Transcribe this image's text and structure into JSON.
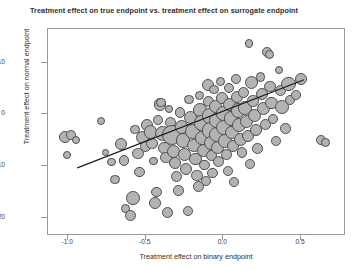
{
  "chart_data": {
    "type": "scatter",
    "title": "Treatment effect on true endpoint vs. treatment effect on surrogate endpoint",
    "xlabel": "Treatment effect on binary endpoint",
    "ylabel": "Treatment effect on normal endpoint",
    "xlim": [
      -1.13,
      0.79
    ],
    "ylim": [
      -23.5,
      16.5
    ],
    "xticks": [
      -1.0,
      -0.5,
      0.0,
      0.5
    ],
    "xtick_labels": [
      "-1.0",
      "-0.5",
      "0.0",
      "0.5"
    ],
    "yticks": [
      10,
      0,
      -10,
      -20
    ],
    "ytick_labels": [
      "10",
      "0",
      "-10",
      "-20"
    ],
    "grid": false,
    "legend": null,
    "marker_fill": "#b3b3b3",
    "marker_edge": "#4f4f4f",
    "line_color": "#1a1a1a",
    "frame_color": "#9a9a9a",
    "regression_line": {
      "x0": -0.94,
      "y0": -10.6,
      "x1": 0.53,
      "y1": 6.6
    },
    "size_encoding": "bubble area proportional to study weight",
    "points": [
      {
        "x": -1.02,
        "y": -4.3,
        "s": 7.5
      },
      {
        "x": -0.98,
        "y": -4.0,
        "s": 6.0
      },
      {
        "x": -0.95,
        "y": -4.9,
        "s": 5.0
      },
      {
        "x": -1.01,
        "y": -7.9,
        "s": 5.0
      },
      {
        "x": -0.79,
        "y": -1.2,
        "s": 5.0
      },
      {
        "x": -0.76,
        "y": -7.3,
        "s": 4.2
      },
      {
        "x": -0.72,
        "y": -9.2,
        "s": 5.5
      },
      {
        "x": -0.7,
        "y": -12.6,
        "s": 6.0
      },
      {
        "x": -0.66,
        "y": -5.8,
        "s": 7.5
      },
      {
        "x": -0.64,
        "y": -8.9,
        "s": 6.5
      },
      {
        "x": -0.63,
        "y": -18.2,
        "s": 6.0
      },
      {
        "x": -0.6,
        "y": -19.6,
        "s": 7.0
      },
      {
        "x": -0.58,
        "y": -16.1,
        "s": 8.5
      },
      {
        "x": -0.57,
        "y": -2.9,
        "s": 6.0
      },
      {
        "x": -0.55,
        "y": -7.6,
        "s": 7.0
      },
      {
        "x": -0.54,
        "y": -11.1,
        "s": 6.5
      },
      {
        "x": -0.52,
        "y": -4.4,
        "s": 8.0
      },
      {
        "x": -0.5,
        "y": -6.2,
        "s": 7.0
      },
      {
        "x": -0.49,
        "y": -2.0,
        "s": 7.5
      },
      {
        "x": -0.47,
        "y": -3.4,
        "s": 8.5
      },
      {
        "x": -0.46,
        "y": -5.6,
        "s": 7.0
      },
      {
        "x": -0.45,
        "y": -9.0,
        "s": 5.5
      },
      {
        "x": -0.44,
        "y": -17.2,
        "s": 7.5
      },
      {
        "x": -0.43,
        "y": -15.0,
        "s": 6.5
      },
      {
        "x": -0.42,
        "y": -1.1,
        "s": 6.0
      },
      {
        "x": -0.41,
        "y": 1.9,
        "s": 7.5
      },
      {
        "x": -0.4,
        "y": 2.3,
        "s": 6.0
      },
      {
        "x": -0.39,
        "y": -3.7,
        "s": 9.5
      },
      {
        "x": -0.38,
        "y": -6.5,
        "s": 8.0
      },
      {
        "x": -0.37,
        "y": -8.3,
        "s": 7.0
      },
      {
        "x": -0.36,
        "y": -18.9,
        "s": 7.0
      },
      {
        "x": -0.35,
        "y": 1.0,
        "s": 5.0
      },
      {
        "x": -0.34,
        "y": -1.6,
        "s": 7.0
      },
      {
        "x": -0.33,
        "y": -4.0,
        "s": 12.5
      },
      {
        "x": -0.32,
        "y": -7.1,
        "s": 8.0
      },
      {
        "x": -0.31,
        "y": -9.4,
        "s": 7.5
      },
      {
        "x": -0.3,
        "y": -12.0,
        "s": 7.0
      },
      {
        "x": -0.29,
        "y": -14.7,
        "s": 6.5
      },
      {
        "x": -0.28,
        "y": 0.4,
        "s": 6.5
      },
      {
        "x": -0.27,
        "y": -2.4,
        "s": 8.5
      },
      {
        "x": -0.26,
        "y": -5.0,
        "s": 9.0
      },
      {
        "x": -0.25,
        "y": -7.8,
        "s": 8.0
      },
      {
        "x": -0.24,
        "y": -10.5,
        "s": 7.5
      },
      {
        "x": -0.23,
        "y": -18.6,
        "s": 6.0
      },
      {
        "x": -0.22,
        "y": 2.9,
        "s": 6.0
      },
      {
        "x": -0.21,
        "y": -0.6,
        "s": 8.0
      },
      {
        "x": -0.2,
        "y": -3.3,
        "s": 9.0
      },
      {
        "x": -0.19,
        "y": -6.0,
        "s": 8.5
      },
      {
        "x": -0.18,
        "y": -8.6,
        "s": 7.5
      },
      {
        "x": -0.17,
        "y": -11.8,
        "s": 7.0
      },
      {
        "x": -0.16,
        "y": -13.9,
        "s": 6.5
      },
      {
        "x": -0.155,
        "y": 3.6,
        "s": 5.5
      },
      {
        "x": -0.15,
        "y": 0.9,
        "s": 8.5
      },
      {
        "x": -0.14,
        "y": -1.7,
        "s": 9.5
      },
      {
        "x": -0.135,
        "y": -4.6,
        "s": 9.0
      },
      {
        "x": -0.13,
        "y": -7.0,
        "s": 8.0
      },
      {
        "x": -0.12,
        "y": -9.8,
        "s": 6.5
      },
      {
        "x": -0.11,
        "y": -12.9,
        "s": 6.0
      },
      {
        "x": -0.1,
        "y": 5.7,
        "s": 7.5
      },
      {
        "x": -0.095,
        "y": 2.5,
        "s": 7.0
      },
      {
        "x": -0.09,
        "y": -0.3,
        "s": 9.5
      },
      {
        "x": -0.085,
        "y": -3.1,
        "s": 10.0
      },
      {
        "x": -0.08,
        "y": -5.5,
        "s": 8.5
      },
      {
        "x": -0.075,
        "y": -8.0,
        "s": 7.0
      },
      {
        "x": -0.07,
        "y": -11.3,
        "s": 6.5
      },
      {
        "x": -0.06,
        "y": 4.8,
        "s": 6.0
      },
      {
        "x": -0.05,
        "y": 1.6,
        "s": 8.0
      },
      {
        "x": -0.045,
        "y": -1.2,
        "s": 9.0
      },
      {
        "x": -0.04,
        "y": -3.9,
        "s": 9.5
      },
      {
        "x": -0.035,
        "y": -6.4,
        "s": 8.0
      },
      {
        "x": -0.03,
        "y": -9.1,
        "s": 7.0
      },
      {
        "x": -0.02,
        "y": 6.4,
        "s": 5.5
      },
      {
        "x": -0.01,
        "y": 3.1,
        "s": 7.5
      },
      {
        "x": 0.0,
        "y": 0.2,
        "s": 9.0
      },
      {
        "x": 0.005,
        "y": -2.5,
        "s": 9.5
      },
      {
        "x": 0.01,
        "y": -5.1,
        "s": 8.5
      },
      {
        "x": 0.02,
        "y": -7.7,
        "s": 7.0
      },
      {
        "x": 0.03,
        "y": -10.9,
        "s": 6.0
      },
      {
        "x": 0.035,
        "y": 5.1,
        "s": 6.5
      },
      {
        "x": 0.04,
        "y": 2.0,
        "s": 8.0
      },
      {
        "x": 0.05,
        "y": -0.8,
        "s": 9.0
      },
      {
        "x": 0.055,
        "y": -3.5,
        "s": 8.5
      },
      {
        "x": 0.06,
        "y": -6.1,
        "s": 7.5
      },
      {
        "x": 0.07,
        "y": -13.1,
        "s": 6.0
      },
      {
        "x": 0.08,
        "y": 6.9,
        "s": 6.0
      },
      {
        "x": 0.09,
        "y": 3.4,
        "s": 7.5
      },
      {
        "x": 0.095,
        "y": 0.7,
        "s": 9.0
      },
      {
        "x": 0.1,
        "y": -2.1,
        "s": 8.5
      },
      {
        "x": 0.11,
        "y": -4.8,
        "s": 8.0
      },
      {
        "x": 0.12,
        "y": -7.4,
        "s": 6.5
      },
      {
        "x": 0.13,
        "y": 4.2,
        "s": 7.0
      },
      {
        "x": 0.14,
        "y": 1.3,
        "s": 8.5
      },
      {
        "x": 0.15,
        "y": -1.4,
        "s": 8.0
      },
      {
        "x": 0.16,
        "y": -4.1,
        "s": 7.5
      },
      {
        "x": 0.165,
        "y": 13.7,
        "s": 5.5
      },
      {
        "x": 0.17,
        "y": -9.6,
        "s": 6.0
      },
      {
        "x": 0.18,
        "y": 6.1,
        "s": 8.0
      },
      {
        "x": 0.19,
        "y": 2.6,
        "s": 7.0
      },
      {
        "x": 0.2,
        "y": -0.2,
        "s": 8.5
      },
      {
        "x": 0.21,
        "y": -3.0,
        "s": 7.5
      },
      {
        "x": 0.22,
        "y": -6.6,
        "s": 6.5
      },
      {
        "x": 0.24,
        "y": 7.2,
        "s": 6.0
      },
      {
        "x": 0.25,
        "y": 3.9,
        "s": 7.5
      },
      {
        "x": 0.26,
        "y": 1.1,
        "s": 8.0
      },
      {
        "x": 0.27,
        "y": -1.9,
        "s": 7.0
      },
      {
        "x": 0.28,
        "y": 12.0,
        "s": 6.0
      },
      {
        "x": 0.295,
        "y": 11.6,
        "s": 5.5
      },
      {
        "x": 0.3,
        "y": 5.4,
        "s": 7.0
      },
      {
        "x": 0.31,
        "y": 2.2,
        "s": 7.5
      },
      {
        "x": 0.32,
        "y": -0.9,
        "s": 6.5
      },
      {
        "x": 0.34,
        "y": -5.2,
        "s": 6.0
      },
      {
        "x": 0.36,
        "y": 8.6,
        "s": 5.0
      },
      {
        "x": 0.37,
        "y": 4.6,
        "s": 7.0
      },
      {
        "x": 0.38,
        "y": 1.5,
        "s": 8.5
      },
      {
        "x": 0.4,
        "y": -2.7,
        "s": 6.5
      },
      {
        "x": 0.42,
        "y": 5.9,
        "s": 9.0
      },
      {
        "x": 0.43,
        "y": 2.8,
        "s": 6.5
      },
      {
        "x": 0.47,
        "y": 3.7,
        "s": 6.0
      },
      {
        "x": 0.5,
        "y": 6.8,
        "s": 7.5
      },
      {
        "x": 0.63,
        "y": -4.9,
        "s": 6.0
      },
      {
        "x": 0.66,
        "y": -5.4,
        "s": 5.5
      }
    ]
  }
}
